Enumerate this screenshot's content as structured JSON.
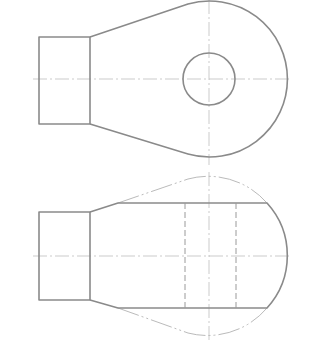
{
  "drawing": {
    "title": "",
    "colors": {
      "outline": "#8a8a8a",
      "center_line": "#b5b5b5",
      "hidden_line": "#9a9a9a",
      "phantom_line": "#a8a8a8",
      "background": "#ffffff"
    },
    "views": [
      {
        "name": "top-view",
        "boss_rect": {
          "x": 39,
          "y": 37,
          "w": 51,
          "h": 87
        },
        "lobe_circle": {
          "cx": 209,
          "cy": 79,
          "r": 78
        },
        "hole_circle": {
          "cx": 209,
          "cy": 79,
          "r": 26
        },
        "center_h": {
          "y": 79,
          "x1": 33,
          "x2": 292
        },
        "center_v": {
          "x": 209,
          "y1": 0,
          "y2": 165
        }
      },
      {
        "name": "front-view",
        "boss_rect": {
          "x": 39,
          "y": 212,
          "w": 51,
          "h": 88
        },
        "body_top_y": 203,
        "body_bottom_y": 308,
        "hidden_lines_x": [
          185,
          236
        ],
        "center_h": {
          "y": 256,
          "x1": 33,
          "x2": 292
        },
        "center_v": {
          "x": 209,
          "y1": 172,
          "y2": 340
        }
      }
    ]
  }
}
